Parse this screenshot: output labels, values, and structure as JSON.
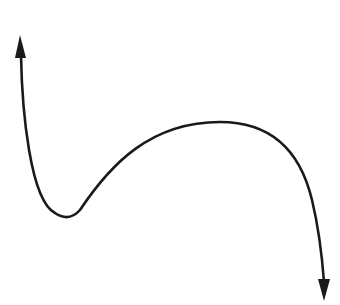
{
  "diagram": {
    "stroke_color": "#1a1a1a",
    "background_color": "#ffffff",
    "curve": {
      "start_arrow": {
        "tip": [
          20,
          35
        ],
        "direction": "up"
      },
      "local_minimum": [
        67,
        218
      ],
      "local_maximum": [
        220,
        122
      ],
      "end_arrow": {
        "tip": [
          324,
          300
        ],
        "direction": "down"
      }
    }
  }
}
